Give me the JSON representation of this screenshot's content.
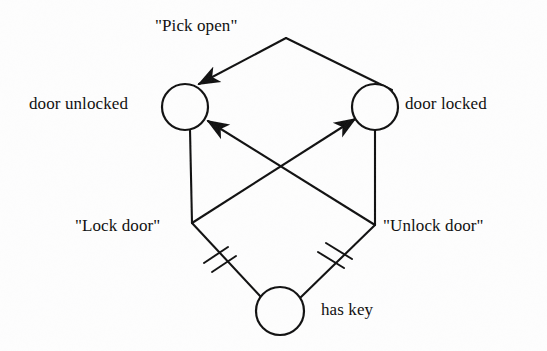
{
  "diagram": {
    "kind": "state-transition-diagram",
    "background_color": "#fdfdfd",
    "stroke_color": "#111111",
    "nodes": [
      {
        "id": "door-unlocked",
        "label": "door unlocked",
        "cx": 185,
        "cy": 107,
        "r": 23,
        "label_side": "left"
      },
      {
        "id": "door-locked",
        "label": "door locked",
        "cx": 375,
        "cy": 107,
        "r": 23,
        "label_side": "right"
      },
      {
        "id": "has-key",
        "label": "has key",
        "cx": 280,
        "cy": 311,
        "r": 24,
        "label_side": "right"
      }
    ],
    "edge_labels": [
      {
        "id": "pick-open",
        "text": "\"Pick open\""
      },
      {
        "id": "lock-door",
        "text": "\"Lock door\""
      },
      {
        "id": "unlock-door",
        "text": "\"Unlock door\""
      }
    ]
  },
  "labels": {
    "pick_open": "\"Pick open\"",
    "door_unlocked": "door unlocked",
    "door_locked": "door locked",
    "lock_door": "\"Lock door\"",
    "unlock_door": "\"Unlock door\"",
    "has_key": "has key"
  }
}
